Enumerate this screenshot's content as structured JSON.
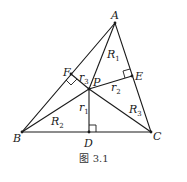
{
  "figure": {
    "caption": "图 3.1",
    "points": {
      "A": {
        "label": "A",
        "x": 115,
        "y": 23
      },
      "B": {
        "label": "B",
        "x": 22,
        "y": 132
      },
      "C": {
        "label": "C",
        "x": 151,
        "y": 132
      },
      "P": {
        "label": "P",
        "x": 89,
        "y": 89
      },
      "D": {
        "label": "D",
        "x": 89,
        "y": 132
      },
      "E": {
        "label": "E",
        "x": 132,
        "y": 76
      },
      "F": {
        "label": "F",
        "x": 71,
        "y": 74
      }
    },
    "segment_labels": {
      "R1": {
        "main": "R",
        "sub": "1"
      },
      "R2": {
        "main": "R",
        "sub": "2"
      },
      "R3": {
        "main": "R",
        "sub": "3"
      },
      "r1": {
        "main": "r",
        "sub": "1"
      },
      "r2": {
        "main": "r",
        "sub": "2"
      },
      "r3": {
        "main": "r",
        "sub": "3"
      }
    },
    "colors": {
      "ink": "#1a1a1a",
      "background": "#ffffff"
    }
  }
}
